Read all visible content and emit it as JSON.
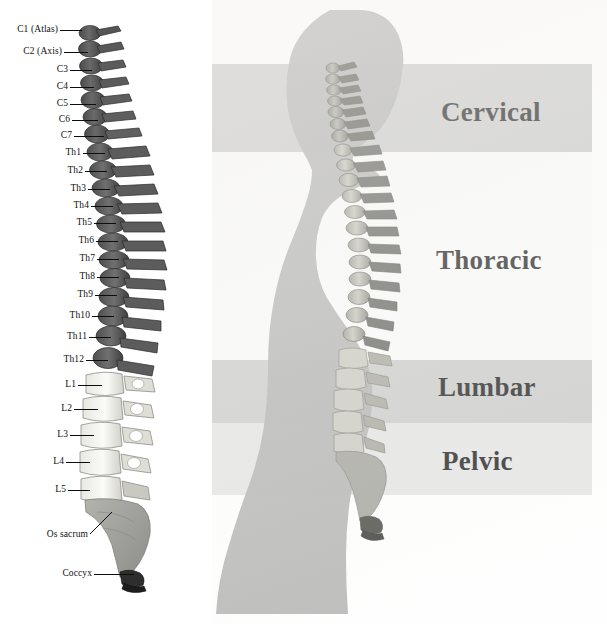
{
  "left_panel": {
    "name": "labelled-spine-diagram",
    "vertebra_labels": [
      {
        "id": "c1",
        "text": "C1 (Atlas)",
        "y": 30,
        "leader_x": 58,
        "leader_w": 22,
        "label_right": 58
      },
      {
        "id": "c2",
        "text": "C2 (Axis)",
        "y": 52,
        "leader_x": 62,
        "leader_w": 24,
        "label_right": 62
      },
      {
        "id": "c3",
        "text": "C3",
        "y": 70,
        "leader_x": 68,
        "leader_w": 22,
        "label_right": 68
      },
      {
        "id": "c4",
        "text": "C4",
        "y": 87,
        "leader_x": 68,
        "leader_w": 24,
        "label_right": 68
      },
      {
        "id": "c5",
        "text": "C5",
        "y": 104,
        "leader_x": 68,
        "leader_w": 26,
        "label_right": 68
      },
      {
        "id": "c6",
        "text": "C6",
        "y": 120,
        "leader_x": 70,
        "leader_w": 26,
        "label_right": 70
      },
      {
        "id": "c7",
        "text": "C7",
        "y": 136,
        "leader_x": 72,
        "leader_w": 30,
        "label_right": 72
      },
      {
        "id": "th1",
        "text": "Th1",
        "y": 153,
        "leader_x": 81,
        "leader_w": 22,
        "label_right": 81
      },
      {
        "id": "th2",
        "text": "Th2",
        "y": 171,
        "leader_x": 83,
        "leader_w": 22,
        "label_right": 83
      },
      {
        "id": "th3",
        "text": "Th3",
        "y": 189,
        "leader_x": 86,
        "leader_w": 22,
        "label_right": 86
      },
      {
        "id": "th4",
        "text": "Th4",
        "y": 206,
        "leader_x": 89,
        "leader_w": 22,
        "label_right": 89
      },
      {
        "id": "th5",
        "text": "Th5",
        "y": 223,
        "leader_x": 92,
        "leader_w": 22,
        "label_right": 92
      },
      {
        "id": "th6",
        "text": "Th6",
        "y": 241,
        "leader_x": 94,
        "leader_w": 22,
        "label_right": 94
      },
      {
        "id": "th7",
        "text": "Th7",
        "y": 259,
        "leader_x": 95,
        "leader_w": 22,
        "label_right": 95
      },
      {
        "id": "th8",
        "text": "Th8",
        "y": 277,
        "leader_x": 95,
        "leader_w": 22,
        "label_right": 95
      },
      {
        "id": "th9",
        "text": "Th9",
        "y": 295,
        "leader_x": 93,
        "leader_w": 22,
        "label_right": 93
      },
      {
        "id": "th10",
        "text": "Th10",
        "y": 316,
        "leader_x": 90,
        "leader_w": 22,
        "label_right": 90
      },
      {
        "id": "th11",
        "text": "Th11",
        "y": 337,
        "leader_x": 87,
        "leader_w": 22,
        "label_right": 87
      },
      {
        "id": "th12",
        "text": "Th12",
        "y": 360,
        "leader_x": 84,
        "leader_w": 22,
        "label_right": 84
      },
      {
        "id": "l1",
        "text": "L1",
        "y": 385,
        "leader_x": 76,
        "leader_w": 24,
        "label_right": 76
      },
      {
        "id": "l2",
        "text": "L2",
        "y": 409,
        "leader_x": 72,
        "leader_w": 24,
        "label_right": 72
      },
      {
        "id": "l3",
        "text": "L3",
        "y": 435,
        "leader_x": 68,
        "leader_w": 24,
        "label_right": 68
      },
      {
        "id": "l4",
        "text": "L4",
        "y": 462,
        "leader_x": 64,
        "leader_w": 24,
        "label_right": 64
      },
      {
        "id": "l5",
        "text": "L5",
        "y": 490,
        "leader_x": 66,
        "leader_w": 22,
        "label_right": 66
      }
    ],
    "sacrum_label": {
      "id": "os-sacrum",
      "text": "Os sacrum",
      "y": 535,
      "label_right": 88
    },
    "coccyx_label": {
      "id": "coccyx",
      "text": "Coccyx",
      "y": 574,
      "leader_x": 92,
      "leader_w": 40,
      "label_right": 92
    }
  },
  "right_panel": {
    "name": "body-silhouette-with-regions",
    "regions": [
      {
        "id": "cervical",
        "label": "Cervical",
        "band_top": 64,
        "band_height": 88,
        "band_color": "#c6c6c6",
        "label_y": 97,
        "label_x": 229,
        "font_size": 27
      },
      {
        "id": "thoracic",
        "label": "Thoracic",
        "band_top": 152,
        "band_height": 208,
        "band_color": "#fbfbfa",
        "label_y": 245,
        "label_x": 224,
        "font_size": 27
      },
      {
        "id": "lumbar",
        "label": "Lumbar",
        "band_top": 360,
        "band_height": 63,
        "band_color": "#c6c6c6",
        "label_y": 372,
        "label_x": 226,
        "font_size": 27
      },
      {
        "id": "pelvic",
        "label": "Pelvic",
        "band_top": 423,
        "band_height": 72,
        "band_color": "#e2e2e2",
        "label_y": 446,
        "label_x": 230,
        "font_size": 27
      }
    ],
    "band_right_edge": 380,
    "silhouette_color": "#a9a9a9"
  },
  "colors": {
    "page_background": "#ffffff",
    "cervical_thoracic_bone": "#5a5a5a",
    "lumbar_bone": "#ededea",
    "sacrum_bone": "#a6a6a2",
    "coccyx_bone": "#2b2b2b",
    "leader_line": "#0d0d0d",
    "text": "#101010"
  }
}
